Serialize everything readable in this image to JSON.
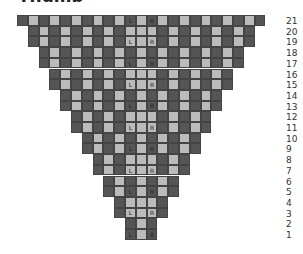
{
  "title": "Thumb",
  "colors": {
    "dark": "#555555",
    "light": "#bbbbbb"
  },
  "grid": {
    "total_columns": 23,
    "center_column": 11,
    "left_label_column": 10,
    "right_label_column": 12,
    "labels": {
      "left": "L",
      "right": "R"
    },
    "rows": [
      {
        "number": 21,
        "start_col": 0,
        "labeled": true
      },
      {
        "number": 20,
        "start_col": 1,
        "labeled": false
      },
      {
        "number": 19,
        "start_col": 1,
        "labeled": true
      },
      {
        "number": 18,
        "start_col": 2,
        "labeled": false
      },
      {
        "number": 17,
        "start_col": 2,
        "labeled": true
      },
      {
        "number": 16,
        "start_col": 3,
        "labeled": false
      },
      {
        "number": 15,
        "start_col": 3,
        "labeled": true
      },
      {
        "number": 14,
        "start_col": 4,
        "labeled": false
      },
      {
        "number": 13,
        "start_col": 4,
        "labeled": true
      },
      {
        "number": 12,
        "start_col": 5,
        "labeled": false
      },
      {
        "number": 11,
        "start_col": 5,
        "labeled": true
      },
      {
        "number": 10,
        "start_col": 6,
        "labeled": false
      },
      {
        "number": 9,
        "start_col": 6,
        "labeled": true
      },
      {
        "number": 8,
        "start_col": 7,
        "labeled": false
      },
      {
        "number": 7,
        "start_col": 7,
        "labeled": true
      },
      {
        "number": 6,
        "start_col": 8,
        "labeled": false
      },
      {
        "number": 5,
        "start_col": 8,
        "labeled": true
      },
      {
        "number": 4,
        "start_col": 9,
        "labeled": false
      },
      {
        "number": 3,
        "start_col": 9,
        "labeled": true
      },
      {
        "number": 2,
        "start_col": 10,
        "labeled": false
      },
      {
        "number": 1,
        "start_col": 10,
        "labeled": true
      }
    ]
  }
}
